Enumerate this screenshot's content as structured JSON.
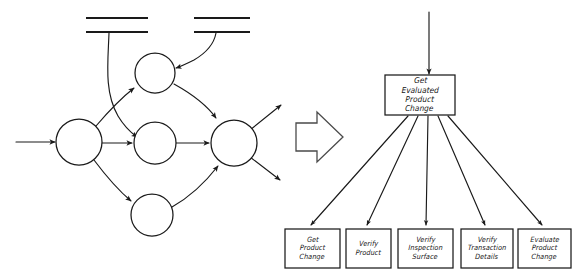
{
  "figure": {
    "ink_color": "#1a1a1a",
    "background": "#ffffff",
    "transform_arrow": {
      "icon": "block-arrow-right-icon",
      "direction": "right"
    }
  },
  "dfd": {
    "name": "data-flow-diagram",
    "processes": [
      {
        "id": "p1",
        "label": "",
        "cx": 79,
        "cy": 142,
        "r": 23
      },
      {
        "id": "p2",
        "label": "",
        "cx": 155,
        "cy": 73,
        "r": 20
      },
      {
        "id": "p3",
        "label": "",
        "cx": 155,
        "cy": 143,
        "r": 21
      },
      {
        "id": "p4",
        "label": "",
        "cx": 234,
        "cy": 143,
        "r": 23
      },
      {
        "id": "p5",
        "label": "",
        "cx": 152,
        "cy": 215,
        "r": 21
      }
    ],
    "data_stores": [
      {
        "id": "d1",
        "label": "",
        "x1": 86,
        "x2": 148,
        "y_top": 18,
        "y_bottom": 32
      },
      {
        "id": "d2",
        "label": "",
        "x1": 194,
        "x2": 250,
        "y_top": 18,
        "y_bottom": 32
      }
    ],
    "flows": [
      {
        "from": "external-input",
        "to": "p1"
      },
      {
        "from": "p1",
        "to": "p2"
      },
      {
        "from": "p1",
        "to": "p3"
      },
      {
        "from": "p1",
        "to": "p5"
      },
      {
        "from": "p3",
        "to": "p4"
      },
      {
        "from": "p5",
        "to": "p4"
      },
      {
        "from": "d1",
        "to": "p3"
      },
      {
        "from": "d2",
        "to": "p2"
      },
      {
        "from": "p2",
        "to": "p4"
      },
      {
        "from": "p4",
        "to": "external-output-upper"
      },
      {
        "from": "p4",
        "to": "external-output-lower"
      }
    ]
  },
  "structure_chart": {
    "name": "structure-chart",
    "root": {
      "id": "root",
      "lines": [
        "Get",
        "Evaluated",
        "Product",
        "Change"
      ],
      "x": 385,
      "y": 75,
      "w": 70,
      "h": 40
    },
    "root_input_arrow": {
      "from_y": 12,
      "to_y": 75,
      "x": 429
    },
    "children": [
      {
        "id": "leaf-1",
        "lines": [
          "Get",
          "Product",
          "Change"
        ],
        "x": 285,
        "y": 229,
        "w": 55,
        "h": 39
      },
      {
        "id": "leaf-2",
        "lines": [
          "Verify",
          "Product"
        ],
        "x": 346,
        "y": 229,
        "w": 45,
        "h": 39
      },
      {
        "id": "leaf-3",
        "lines": [
          "Verify",
          "Inspection",
          "Surface"
        ],
        "x": 398,
        "y": 229,
        "w": 55,
        "h": 39
      },
      {
        "id": "leaf-4",
        "lines": [
          "Verify",
          "Transaction",
          "Details"
        ],
        "x": 461,
        "y": 229,
        "w": 52,
        "h": 39
      },
      {
        "id": "leaf-5",
        "lines": [
          "Evaluate",
          "Product",
          "Change"
        ],
        "x": 518,
        "y": 229,
        "w": 53,
        "h": 39
      }
    ]
  }
}
